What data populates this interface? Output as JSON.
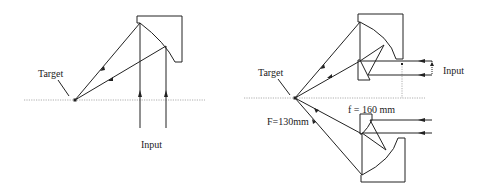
{
  "left_diagram": {
    "target_label": "Target",
    "input_label": "Input"
  },
  "right_diagram": {
    "target_label": "Target",
    "input_label": "Input",
    "focal_big_label": "F=130mm",
    "focal_small_label": "f = 160 mm"
  },
  "colors": {
    "line": "#222222",
    "axis": "#999999",
    "background": "#ffffff"
  }
}
